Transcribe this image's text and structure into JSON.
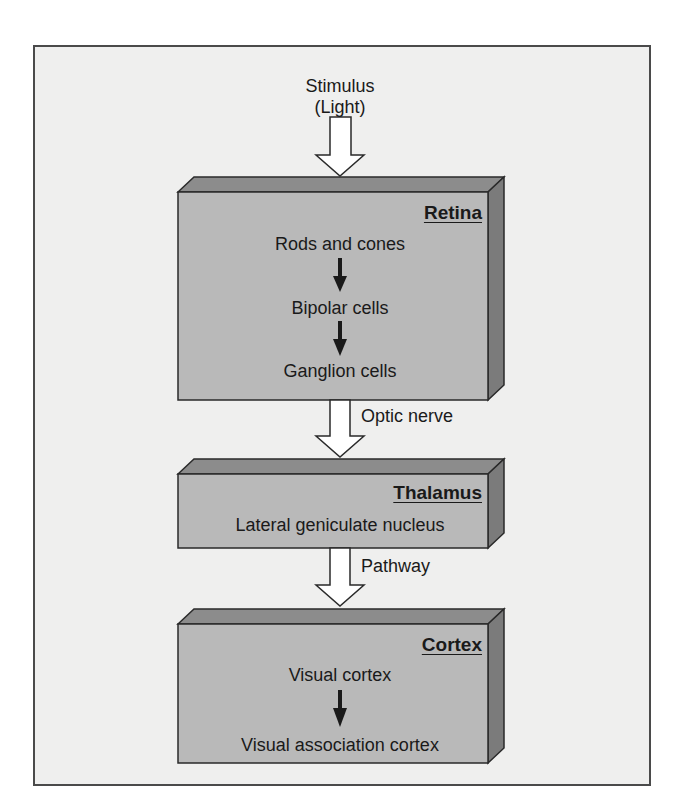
{
  "stimulus": {
    "line1": "Stimulus",
    "line2": "(Light)"
  },
  "boxes": [
    {
      "title": "Retina",
      "items": [
        "Rods and cones",
        "Bipolar cells",
        "Ganglion cells"
      ]
    },
    {
      "title": "Thalamus",
      "items": [
        "Lateral geniculate nucleus"
      ]
    },
    {
      "title": "Cortex",
      "items": [
        "Visual cortex",
        "Visual association cortex"
      ]
    }
  ],
  "connectors": [
    {
      "label": "Optic nerve"
    },
    {
      "label": "Pathway"
    }
  ],
  "colors": {
    "background": "#efefee",
    "box_front": "#b9b9b9",
    "box_top": "#8c8c8c",
    "box_side": "#7b7b7b",
    "outline": "#2a2a2a",
    "arrow_fill": "#ffffff"
  }
}
